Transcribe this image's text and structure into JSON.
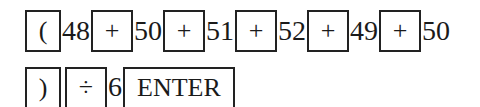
{
  "row1": {
    "open_paren": "(",
    "n1": "48",
    "plus1": "+",
    "n2": "50",
    "plus2": "+",
    "n3": "51",
    "plus3": "+",
    "n4": "52",
    "plus4": "+",
    "n5": "49",
    "plus5": "+",
    "n6": "50"
  },
  "row2": {
    "close_paren": ")",
    "divide": "÷",
    "divisor": "6",
    "enter": "ENTER"
  }
}
